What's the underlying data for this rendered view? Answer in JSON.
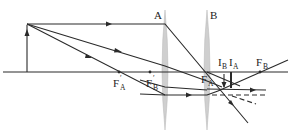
{
  "figure": {
    "type": "two-lens ray diagram",
    "background": "#ffffff",
    "line_color": "#2a2a2a",
    "lens_color": "#cfcfcf"
  },
  "lenses": [
    {
      "id": "A",
      "label": "A",
      "x": 165
    },
    {
      "id": "B",
      "label": "B",
      "x": 207
    }
  ],
  "labels": {
    "lens_a": "A",
    "lens_b": "B",
    "focal_a_prime": {
      "main": "F",
      "prime": "′",
      "sub": "A"
    },
    "focal_b_prime": {
      "main": "F",
      "prime": "′",
      "sub": "B"
    },
    "focal_a": {
      "main": "F",
      "sub": "A"
    },
    "focal_b": {
      "main": "F",
      "sub": "B"
    },
    "image_b": {
      "main": "I",
      "sub": "B"
    },
    "image_a": {
      "main": "I",
      "sub": "A"
    }
  },
  "object": {
    "label": "object arrow",
    "x": 27,
    "base_y": 72,
    "tip_y": 24
  },
  "optical_axis": {
    "y": 72,
    "x_start": 3,
    "x_end": 288
  }
}
